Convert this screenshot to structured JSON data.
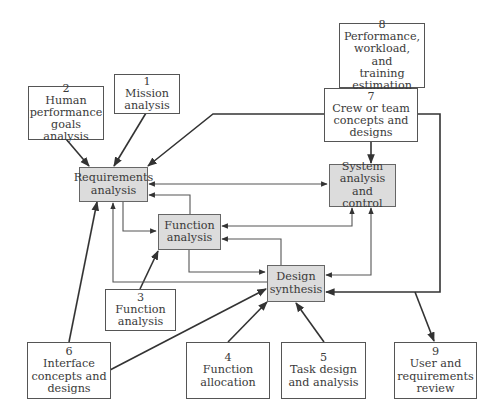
{
  "diagram": {
    "type": "process-flow",
    "core_nodes": [
      {
        "id": "req",
        "label": "Requirements\nanalysis"
      },
      {
        "id": "sys",
        "label": "System\nanalysis and\ncontrol"
      },
      {
        "id": "func",
        "label": "Function\nanalysis"
      },
      {
        "id": "design",
        "label": "Design\nsynthesis"
      }
    ],
    "input_nodes": [
      {
        "id": "n1",
        "number": "1",
        "label": "Mission\nanalysis"
      },
      {
        "id": "n2",
        "number": "2",
        "label": "Human\nperformance\ngoals analysis"
      },
      {
        "id": "n3",
        "number": "3",
        "label": "Function\nanalysis"
      },
      {
        "id": "n4",
        "number": "4",
        "label": "Function\nallocation"
      },
      {
        "id": "n5",
        "number": "5",
        "label": "Task design\nand analysis"
      },
      {
        "id": "n6",
        "number": "6",
        "label": "Interface\nconcepts and\ndesigns"
      },
      {
        "id": "n7",
        "number": "7",
        "label": "Crew or team\nconcepts and\ndesigns"
      },
      {
        "id": "n8",
        "number": "8",
        "label": "Performance,\nworkload, and\ntraining\nestimation"
      },
      {
        "id": "n9",
        "number": "9",
        "label": "User and\nrequirements\nreview"
      }
    ],
    "edges": [
      {
        "from": "n2",
        "to": "req"
      },
      {
        "from": "n1",
        "to": "req"
      },
      {
        "from": "n7",
        "to": "req"
      },
      {
        "from": "n7",
        "to": "sys"
      },
      {
        "from": "n7",
        "to": "design"
      },
      {
        "from": "req",
        "to": "sys",
        "bidirectional": true
      },
      {
        "from": "req",
        "to": "func"
      },
      {
        "from": "func",
        "to": "req"
      },
      {
        "from": "func",
        "to": "sys",
        "bidirectional": true
      },
      {
        "from": "func",
        "to": "design"
      },
      {
        "from": "design",
        "to": "func"
      },
      {
        "from": "design",
        "to": "req"
      },
      {
        "from": "design",
        "to": "sys",
        "bidirectional": true
      },
      {
        "from": "n3",
        "to": "func"
      },
      {
        "from": "n6",
        "to": "req"
      },
      {
        "from": "n6",
        "to": "design"
      },
      {
        "from": "n4",
        "to": "design"
      },
      {
        "from": "n5",
        "to": "design"
      },
      {
        "from": "n7",
        "to": "n9"
      }
    ],
    "colors": {
      "core_fill": "#dcdcdc",
      "line": "#333333",
      "border": "#555555"
    }
  }
}
